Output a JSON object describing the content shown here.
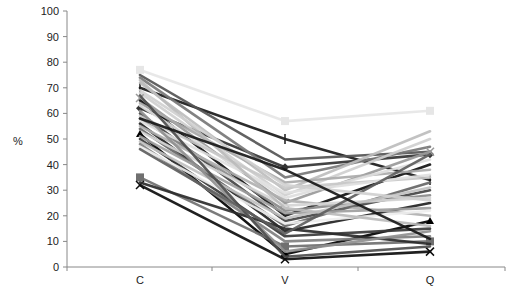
{
  "chart_data": {
    "type": "line",
    "title": "",
    "xlabel": "",
    "ylabel": "%",
    "ylim": [
      0,
      100
    ],
    "yticks": [
      0,
      10,
      20,
      30,
      40,
      50,
      60,
      70,
      80,
      90,
      100
    ],
    "grid": false,
    "legend": "none",
    "categories": [
      "C",
      "V",
      "Q"
    ],
    "series": [
      {
        "name": "s1",
        "color": "#e6e6e6",
        "marker": "square",
        "values": [
          77,
          57,
          61
        ]
      },
      {
        "name": "s2",
        "color": "#1a1a1a",
        "marker": "dash",
        "values": [
          70,
          50,
          34
        ]
      },
      {
        "name": "s3",
        "color": "#333333",
        "marker": "diamond",
        "values": [
          62,
          39,
          44
        ]
      },
      {
        "name": "s4",
        "color": "#555555",
        "marker": "none",
        "values": [
          75,
          42,
          45
        ]
      },
      {
        "name": "s5",
        "color": "#777777",
        "marker": "none",
        "values": [
          74,
          35,
          47
        ]
      },
      {
        "name": "s6",
        "color": "#bdbdbd",
        "marker": "none",
        "values": [
          72,
          30,
          53
        ]
      },
      {
        "name": "s7",
        "color": "#cfcfcf",
        "marker": "none",
        "values": [
          68,
          28,
          50
        ]
      },
      {
        "name": "s8",
        "color": "#999999",
        "marker": "x",
        "values": [
          66,
          25,
          45
        ]
      },
      {
        "name": "s9",
        "color": "#111111",
        "marker": "none",
        "values": [
          65,
          20,
          40
        ]
      },
      {
        "name": "s10",
        "color": "#aaaaaa",
        "marker": "none",
        "values": [
          64,
          33,
          38
        ]
      },
      {
        "name": "s11",
        "color": "#dddddd",
        "marker": "none",
        "values": [
          63,
          27,
          42
        ]
      },
      {
        "name": "s12",
        "color": "#444444",
        "marker": "none",
        "values": [
          60,
          18,
          30
        ]
      },
      {
        "name": "s13",
        "color": "#c8c8c8",
        "marker": "none",
        "values": [
          59,
          31,
          35
        ]
      },
      {
        "name": "s14",
        "color": "#8a8a8a",
        "marker": "none",
        "values": [
          58,
          22,
          28
        ]
      },
      {
        "name": "s15",
        "color": "#e0e0e0",
        "marker": "none",
        "values": [
          57,
          29,
          36
        ]
      },
      {
        "name": "s16",
        "color": "#222222",
        "marker": "none",
        "values": [
          56,
          14,
          25
        ]
      },
      {
        "name": "s17",
        "color": "#b0b0b0",
        "marker": "none",
        "values": [
          55,
          26,
          20
        ]
      },
      {
        "name": "s18",
        "color": "#666666",
        "marker": "none",
        "values": [
          54,
          16,
          33
        ]
      },
      {
        "name": "s19",
        "color": "#d5d5d5",
        "marker": "none",
        "values": [
          53,
          24,
          27
        ]
      },
      {
        "name": "s20",
        "color": "#000000",
        "marker": "triangle",
        "values": [
          52,
          5,
          18
        ]
      },
      {
        "name": "s21",
        "color": "#a0a0a0",
        "marker": "none",
        "values": [
          51,
          21,
          23
        ]
      },
      {
        "name": "s22",
        "color": "#3a3a3a",
        "marker": "none",
        "values": [
          50,
          12,
          15
        ]
      },
      {
        "name": "s23",
        "color": "#c0c0c0",
        "marker": "none",
        "values": [
          49,
          19,
          31
        ]
      },
      {
        "name": "s24",
        "color": "#808080",
        "marker": "none",
        "values": [
          48,
          10,
          12
        ]
      },
      {
        "name": "s25",
        "color": "#eeeeee",
        "marker": "none",
        "values": [
          47,
          17,
          22
        ]
      },
      {
        "name": "s26",
        "color": "#707070",
        "marker": "square",
        "values": [
          35,
          8,
          10
        ]
      },
      {
        "name": "s27",
        "color": "#0d0d0d",
        "marker": "x",
        "values": [
          32,
          3,
          6
        ]
      },
      {
        "name": "s28",
        "color": "#2b2b2b",
        "marker": "none",
        "values": [
          33,
          15,
          9
        ]
      },
      {
        "name": "s29",
        "color": "#909090",
        "marker": "none",
        "values": [
          61,
          6,
          14
        ]
      },
      {
        "name": "s30",
        "color": "#4d4d4d",
        "marker": "none",
        "values": [
          67,
          4,
          8
        ]
      },
      {
        "name": "s31",
        "color": "#bbbbbb",
        "marker": "none",
        "values": [
          73,
          23,
          16
        ]
      },
      {
        "name": "s32",
        "color": "#5e5e5e",
        "marker": "none",
        "values": [
          46,
          13,
          44
        ]
      },
      {
        "name": "s33",
        "color": "#d0d0d0",
        "marker": "none",
        "values": [
          69,
          32,
          26
        ]
      },
      {
        "name": "s34",
        "color": "#181818",
        "marker": "none",
        "values": [
          58,
          38,
          11
        ]
      }
    ]
  },
  "axes": {
    "ylabel": "%",
    "yticks": [
      "0",
      "10",
      "20",
      "30",
      "40",
      "50",
      "60",
      "70",
      "80",
      "90",
      "100"
    ],
    "xcats": [
      "C",
      "V",
      "Q"
    ]
  }
}
